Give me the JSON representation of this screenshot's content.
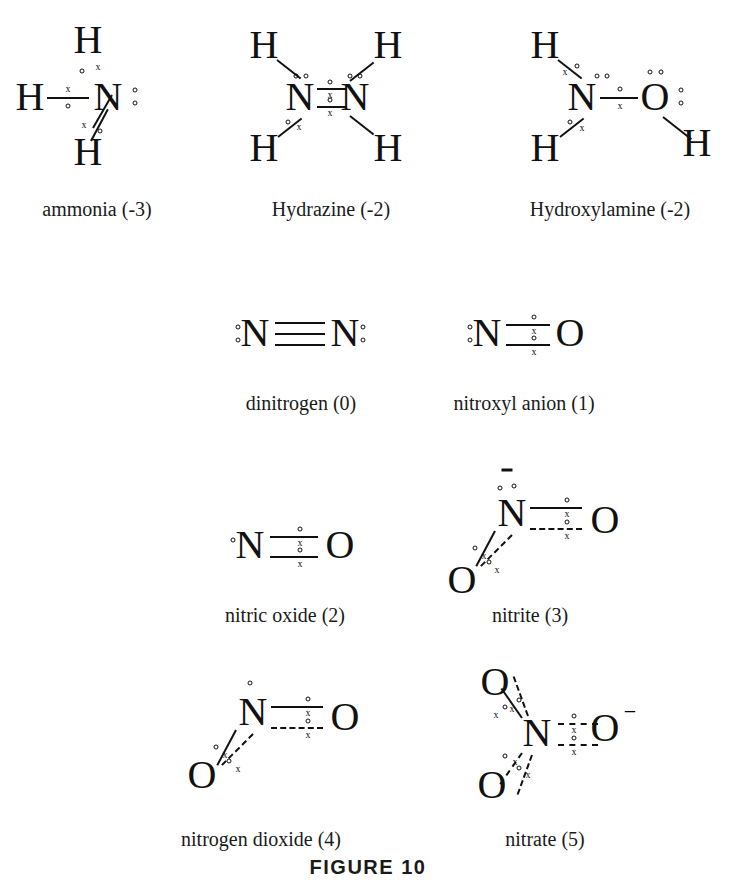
{
  "figure": {
    "title": "FIGURE 10"
  },
  "structures": [
    {
      "id": "ammonia",
      "caption": "ammonia (-3)",
      "formula": "NH3",
      "center_atom": "N",
      "bonded_atoms": [
        "H",
        "H",
        "H"
      ],
      "lone_pairs_on_center": 1,
      "charge": "",
      "bond_orders": [
        1,
        1,
        1
      ],
      "index": "-3"
    },
    {
      "id": "hydrazine",
      "caption": "Hydrazine (-2)",
      "formula": "N2H4",
      "center_atom": "N",
      "bonded_atoms": [
        "H",
        "H",
        "N",
        "H",
        "H"
      ],
      "lone_pairs_on_center": 1,
      "charge": "",
      "bond_orders": [
        1,
        1,
        1,
        1
      ],
      "index": "-2"
    },
    {
      "id": "hydroxylamine",
      "caption": "Hydroxylamine (-2)",
      "formula": "NH2OH",
      "center_atom": "N",
      "bonded_atoms": [
        "H",
        "H",
        "O",
        "H"
      ],
      "lone_pairs_on_center": 1,
      "charge": "",
      "bond_orders": [
        1,
        1,
        1
      ],
      "index": "-2"
    },
    {
      "id": "dinitrogen",
      "caption": "dinitrogen (0)",
      "formula": "N2",
      "center_atom": "N",
      "bonded_atoms": [
        "N"
      ],
      "lone_pairs_on_center": 1,
      "charge": "",
      "bond_orders": [
        3
      ],
      "index": "0"
    },
    {
      "id": "nitroxyl-anion",
      "caption": "nitroxyl anion (1)",
      "formula": "NO-",
      "center_atom": "N",
      "bonded_atoms": [
        "O"
      ],
      "lone_pairs_on_center": 1,
      "charge": "",
      "bond_orders": [
        2
      ],
      "index": "1"
    },
    {
      "id": "nitric-oxide",
      "caption": "nitric oxide (2)",
      "formula": "NO",
      "center_atom": "N",
      "bonded_atoms": [
        "O"
      ],
      "lone_pairs_on_center": 0,
      "unpaired_electrons_on_center": 1,
      "charge": "",
      "bond_orders": [
        2
      ],
      "index": "2"
    },
    {
      "id": "nitrite",
      "caption": "nitrite (3)",
      "formula": "NO2-",
      "center_atom": "N",
      "bonded_atoms": [
        "O",
        "O"
      ],
      "lone_pairs_on_center": 1,
      "charge": "-",
      "bond_orders": [
        2,
        1
      ],
      "index": "3"
    },
    {
      "id": "nitrogen-dioxide",
      "caption": "nitrogen dioxide (4)",
      "formula": "NO2",
      "center_atom": "N",
      "bonded_atoms": [
        "O",
        "O"
      ],
      "lone_pairs_on_center": 0,
      "unpaired_electrons_on_center": 1,
      "charge": "",
      "bond_orders": [
        2,
        1
      ],
      "index": "4"
    },
    {
      "id": "nitrate",
      "caption": "nitrate (5)",
      "formula": "NO3-",
      "center_atom": "N",
      "bonded_atoms": [
        "O",
        "O",
        "O"
      ],
      "lone_pairs_on_center": 0,
      "charge": "-",
      "bond_orders": [
        1,
        1,
        2
      ],
      "index": "5"
    }
  ],
  "atom_labels": {
    "H": "H",
    "N": "N",
    "O": "O",
    "minus": "−",
    "electron_x": "x",
    "electron_o": "o"
  }
}
